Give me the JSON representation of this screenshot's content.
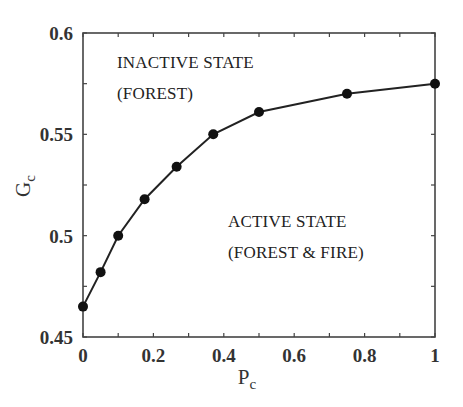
{
  "chart_data": {
    "type": "line",
    "title": "",
    "xlabel": "P_c",
    "ylabel": "G_c",
    "xlim": [
      0,
      1
    ],
    "ylim": [
      0.45,
      0.6
    ],
    "grid": false,
    "legend": null,
    "x_ticks": [
      "0",
      "0.2",
      "0.4",
      "0.6",
      "0.8",
      "1"
    ],
    "y_ticks": [
      "0.45",
      "0.5",
      "0.55",
      "0.6"
    ],
    "series": [
      {
        "name": "critical line",
        "marker": "filled-circle",
        "x": [
          0,
          0.05,
          0.1,
          0.175,
          0.266,
          0.37,
          0.5,
          0.75,
          1.0
        ],
        "y": [
          0.465,
          0.482,
          0.5,
          0.518,
          0.534,
          0.55,
          0.561,
          0.57,
          0.575
        ]
      }
    ],
    "annotations": [
      {
        "lines": [
          "INACTIVE STATE",
          "(FOREST)"
        ],
        "position": "upper-left"
      },
      {
        "lines": [
          "ACTIVE STATE",
          "(FOREST & FIRE)"
        ],
        "position": "lower-right"
      }
    ]
  },
  "labels": {
    "xlabel_main": "P",
    "xlabel_sub": "c",
    "ylabel_main": "G",
    "ylabel_sub": "c",
    "annot_inactive_1": "INACTIVE STATE",
    "annot_inactive_2": "(FOREST)",
    "annot_active_1": "ACTIVE STATE",
    "annot_active_2": "(FOREST & FIRE)"
  },
  "colors": {
    "line": "#222222",
    "marker": "#111111",
    "axis": "#444444"
  }
}
